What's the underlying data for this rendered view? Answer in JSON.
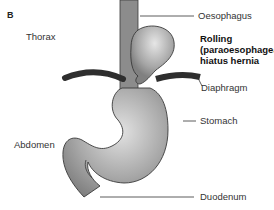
{
  "panel_label": "B",
  "regions": {
    "thorax": "Thorax",
    "abdomen": "Abdomen"
  },
  "labels": {
    "oesophagus": "Oesophagus",
    "title_line1": "Rolling",
    "title_line2": "(paraoesophageal)",
    "title_line3": "hiatus hernia",
    "diaphragm": "Diaphragm",
    "stomach": "Stomach",
    "duodenum": "Duodenum"
  },
  "colors": {
    "organ_fill": "#9a9a9a",
    "organ_highlight": "#d8d8d8",
    "outline": "#3a3a3a",
    "diaphragm": "#2e2e2e",
    "leader_line": "#333333"
  }
}
